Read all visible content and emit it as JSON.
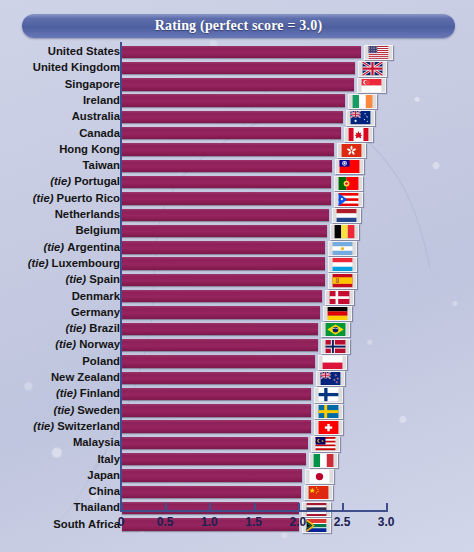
{
  "header": {
    "title": "Rating (perfect score = 3.0)"
  },
  "axis": {
    "ticks": [
      "0",
      "0.5",
      "1.0",
      "1.5",
      "2.0",
      "2.5",
      "3.0"
    ]
  },
  "chart_data": {
    "type": "bar",
    "orientation": "horizontal",
    "title": "Rating (perfect score = 3.0)",
    "xlabel": "",
    "ylabel": "",
    "xlim": [
      0,
      3.0
    ],
    "xticks": [
      0,
      0.5,
      1.0,
      1.5,
      2.0,
      2.5,
      3.0
    ],
    "grid": false,
    "legend": "none",
    "bar_color": "#8e2059",
    "accent_color": "#4e5fa0",
    "background_color": "#c6cbe2",
    "categories": [
      "United States",
      "United Kingdom",
      "Singapore",
      "Ireland",
      "Australia",
      "Canada",
      "Hong Kong",
      "Taiwan",
      "(tie) Portugal",
      "(tie) Puerto Rico",
      "Netherlands",
      "Belgium",
      "(tie) Argentina",
      "(tie) Luxembourg",
      "(tie) Spain",
      "Denmark",
      "Germany",
      "(tie) Brazil",
      "(tie) Norway",
      "Poland",
      "New Zealand",
      "(tie) Finland",
      "(tie) Sweden",
      "(tie) Switzerland",
      "Malaysia",
      "Italy",
      "Japan",
      "China",
      "Thailand",
      "South Africa"
    ],
    "values": [
      2.7,
      2.64,
      2.62,
      2.52,
      2.5,
      2.48,
      2.4,
      2.38,
      2.36,
      2.36,
      2.34,
      2.32,
      2.3,
      2.3,
      2.3,
      2.26,
      2.24,
      2.22,
      2.22,
      2.18,
      2.16,
      2.14,
      2.14,
      2.14,
      2.1,
      2.08,
      2.04,
      2.02,
      2.0,
      2.0
    ],
    "rows": [
      {
        "label": "United States",
        "tie": false,
        "value": 2.7,
        "flag": "flag-united-states"
      },
      {
        "label": "United Kingdom",
        "tie": false,
        "value": 2.64,
        "flag": "flag-united-kingdom"
      },
      {
        "label": "Singapore",
        "tie": false,
        "value": 2.62,
        "flag": "flag-singapore"
      },
      {
        "label": "Ireland",
        "tie": false,
        "value": 2.52,
        "flag": "flag-ireland"
      },
      {
        "label": "Australia",
        "tie": false,
        "value": 2.5,
        "flag": "flag-australia"
      },
      {
        "label": "Canada",
        "tie": false,
        "value": 2.48,
        "flag": "flag-canada"
      },
      {
        "label": "Hong Kong",
        "tie": false,
        "value": 2.4,
        "flag": "flag-hong-kong"
      },
      {
        "label": "Taiwan",
        "tie": false,
        "value": 2.38,
        "flag": "flag-taiwan"
      },
      {
        "label": "Portugal",
        "tie": true,
        "value": 2.36,
        "flag": "flag-portugal"
      },
      {
        "label": "Puerto Rico",
        "tie": true,
        "value": 2.36,
        "flag": "flag-puerto-rico"
      },
      {
        "label": "Netherlands",
        "tie": false,
        "value": 2.34,
        "flag": "flag-netherlands"
      },
      {
        "label": "Belgium",
        "tie": false,
        "value": 2.32,
        "flag": "flag-belgium"
      },
      {
        "label": "Argentina",
        "tie": true,
        "value": 2.3,
        "flag": "flag-argentina"
      },
      {
        "label": "Luxembourg",
        "tie": true,
        "value": 2.3,
        "flag": "flag-luxembourg"
      },
      {
        "label": "Spain",
        "tie": true,
        "value": 2.3,
        "flag": "flag-spain"
      },
      {
        "label": "Denmark",
        "tie": false,
        "value": 2.26,
        "flag": "flag-denmark"
      },
      {
        "label": "Germany",
        "tie": false,
        "value": 2.24,
        "flag": "flag-germany"
      },
      {
        "label": "Brazil",
        "tie": true,
        "value": 2.22,
        "flag": "flag-brazil"
      },
      {
        "label": "Norway",
        "tie": true,
        "value": 2.22,
        "flag": "flag-norway"
      },
      {
        "label": "Poland",
        "tie": false,
        "value": 2.18,
        "flag": "flag-poland"
      },
      {
        "label": "New Zealand",
        "tie": false,
        "value": 2.16,
        "flag": "flag-new-zealand"
      },
      {
        "label": "Finland",
        "tie": true,
        "value": 2.14,
        "flag": "flag-finland"
      },
      {
        "label": "Sweden",
        "tie": true,
        "value": 2.14,
        "flag": "flag-sweden"
      },
      {
        "label": "Switzerland",
        "tie": true,
        "value": 2.14,
        "flag": "flag-switzerland"
      },
      {
        "label": "Malaysia",
        "tie": false,
        "value": 2.1,
        "flag": "flag-malaysia"
      },
      {
        "label": "Italy",
        "tie": false,
        "value": 2.08,
        "flag": "flag-italy"
      },
      {
        "label": "Japan",
        "tie": false,
        "value": 2.04,
        "flag": "flag-japan"
      },
      {
        "label": "China",
        "tie": false,
        "value": 2.02,
        "flag": "flag-china"
      },
      {
        "label": "Thailand",
        "tie": false,
        "value": 2.0,
        "flag": "flag-thailand"
      },
      {
        "label": "South Africa",
        "tie": false,
        "value": 2.0,
        "flag": "flag-south-africa"
      }
    ]
  }
}
